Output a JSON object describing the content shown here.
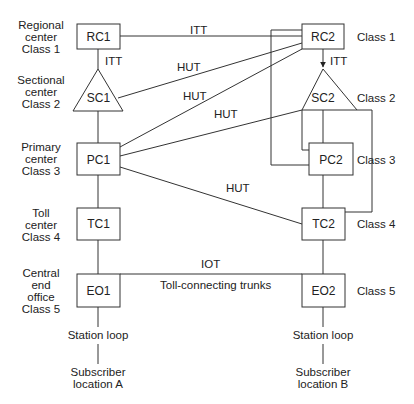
{
  "diagram": {
    "type": "hierarchical telephone switching network",
    "colors": {
      "line": "#333333",
      "text": "#222222",
      "background": "#ffffff"
    },
    "left_labels": [
      {
        "line1": "Regional",
        "line2": "center",
        "line3": "Class 1"
      },
      {
        "line1": "Sectional",
        "line2": "center",
        "line3": "Class 2"
      },
      {
        "line1": "Primary",
        "line2": "center",
        "line3": "Class 3"
      },
      {
        "line1": "Toll",
        "line2": "center",
        "line3": "Class 4"
      },
      {
        "line1": "Central",
        "line2": "end",
        "line3": "office",
        "line4": "Class 5"
      }
    ],
    "right_labels": [
      "Class 1",
      "Class 2",
      "Class 3",
      "Class 4",
      "Class 5"
    ],
    "nodes": {
      "rc1": "RC1",
      "sc1": "SC1",
      "pc1": "PC1",
      "tc1": "TC1",
      "eo1": "EO1",
      "rc2": "RC2",
      "sc2": "SC2",
      "pc2": "PC2",
      "tc2": "TC2",
      "eo2": "EO2"
    },
    "trunk_labels": {
      "itt_rc1_rc2": "ITT",
      "itt_rc1_sc1": "ITT",
      "itt_rc2_sc2": "ITT",
      "hut_sc1_rc2": "HUT",
      "hut_pc1_rc2": "HUT",
      "hut_pc1_sc2": "HUT",
      "hut_pc1_tc2": "HUT",
      "iot": "IOT",
      "toll_connecting": "Toll-connecting trunks"
    },
    "bottom": {
      "station_loop_a": "Station loop",
      "station_loop_b": "Station loop",
      "subscriber_a_line1": "Subscriber",
      "subscriber_a_line2": "location A",
      "subscriber_b_line1": "Subscriber",
      "subscriber_b_line2": "location B"
    },
    "edges": [
      {
        "from": "RC1",
        "to": "RC2",
        "label": "ITT"
      },
      {
        "from": "RC1",
        "to": "SC1",
        "label": "ITT"
      },
      {
        "from": "RC2",
        "to": "SC2",
        "label": "ITT",
        "arrow": true
      },
      {
        "from": "SC1",
        "to": "RC2",
        "label": "HUT"
      },
      {
        "from": "PC1",
        "to": "RC2",
        "label": "HUT"
      },
      {
        "from": "PC1",
        "to": "SC2",
        "label": "HUT"
      },
      {
        "from": "PC1",
        "to": "TC2",
        "label": "HUT"
      },
      {
        "from": "SC1",
        "to": "PC1"
      },
      {
        "from": "PC1",
        "to": "TC1"
      },
      {
        "from": "TC1",
        "to": "EO1"
      },
      {
        "from": "TC1",
        "to": "EO2",
        "label": "IOT"
      },
      {
        "from": "EO1",
        "to": "EO2",
        "label": "Toll-connecting trunks"
      },
      {
        "from": "RC2",
        "to": "PC2"
      },
      {
        "from": "SC2",
        "to": "PC2"
      },
      {
        "from": "SC2",
        "to": "TC2"
      },
      {
        "from": "PC2",
        "to": "TC2"
      },
      {
        "from": "TC2",
        "to": "EO2"
      }
    ]
  }
}
